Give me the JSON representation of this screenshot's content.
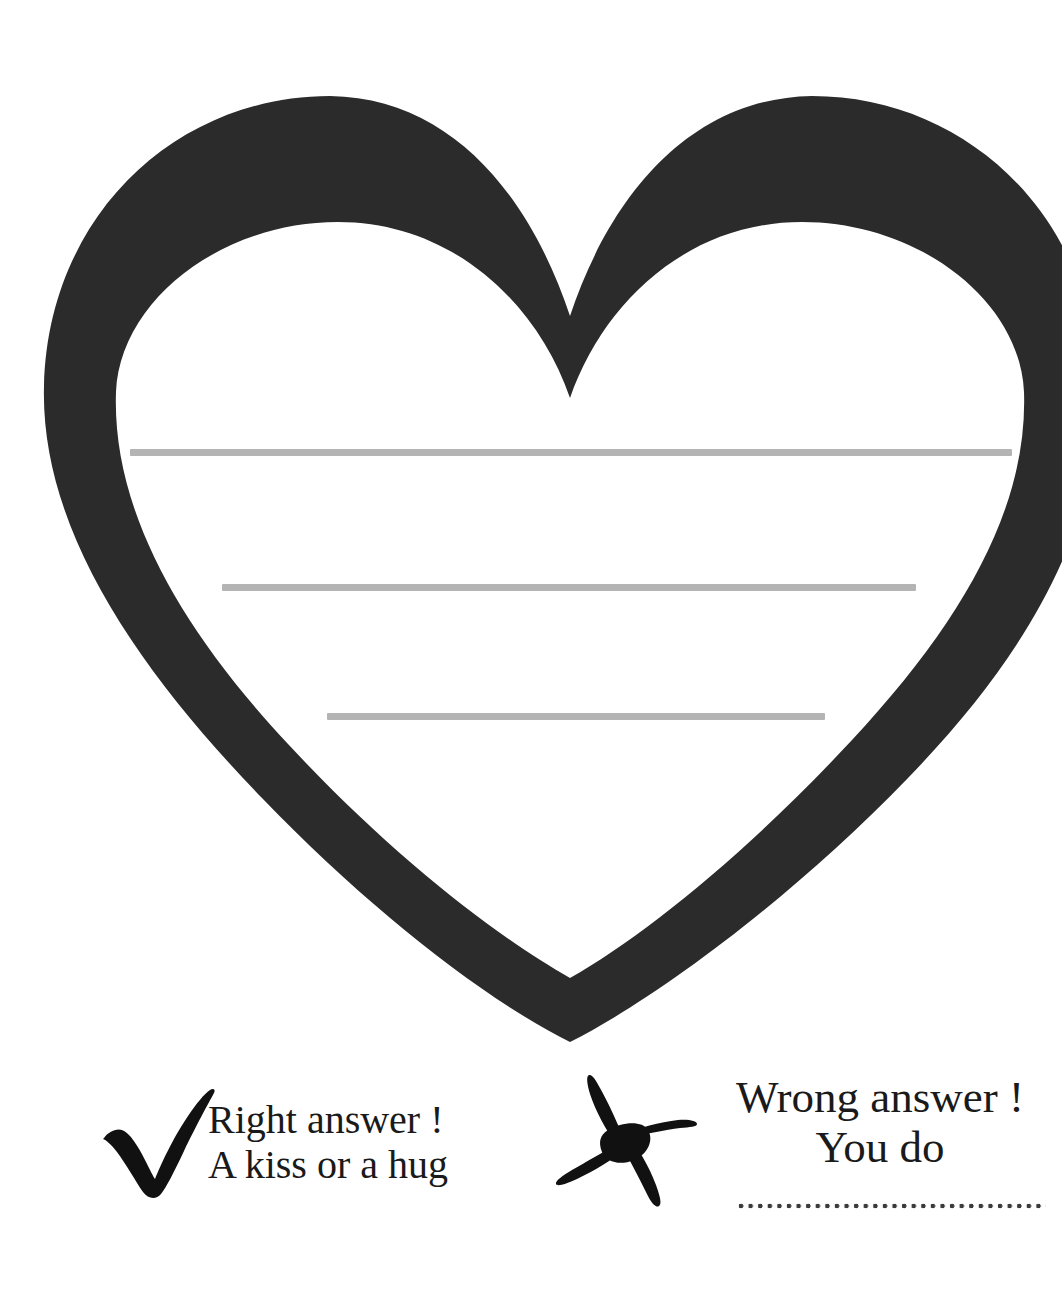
{
  "page": {
    "background_color": "#ffffff",
    "width": 1062,
    "height": 1299
  },
  "heart": {
    "name": "heart-outline",
    "stroke_color": "#2b2b2b",
    "fill_color": "#ffffff",
    "stroke_width_px": 30,
    "description": "Large empty heart outline occupying the top portion of the page, used as a writing space"
  },
  "writing_lines": [
    {
      "id": "line-1",
      "y": 452,
      "x_start": 130,
      "x_end": 1012,
      "color": "#b4b4b4"
    },
    {
      "id": "line-2",
      "y": 587,
      "x_start": 222,
      "x_end": 916,
      "color": "#b4b4b4"
    },
    {
      "id": "line-3",
      "y": 716,
      "x_start": 327,
      "x_end": 825,
      "color": "#b4b4b4"
    }
  ],
  "legend": {
    "correct": {
      "icon": "check-mark-icon",
      "icon_color": "#111111",
      "line1": "Right answer !",
      "line2": "A kiss or a hug"
    },
    "incorrect": {
      "icon": "cross-mark-icon",
      "icon_color": "#111111",
      "line1": "Wrong answer !",
      "line2": "You do",
      "fill_in_line": "dotted-line",
      "fill_in_dot_color": "#3a3a3a"
    }
  }
}
